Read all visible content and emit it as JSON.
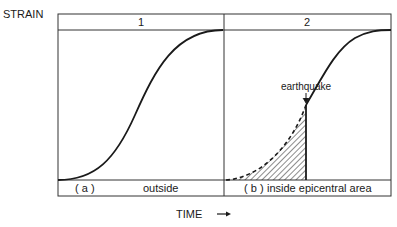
{
  "diagram": {
    "y_axis_label": "STRAIN",
    "x_axis_label": "TIME",
    "x_axis_arrow": "→",
    "panels": [
      {
        "number": "1",
        "caption_letter": "( a )",
        "caption_text": "outside"
      },
      {
        "number": "2",
        "caption_letter": "( b )",
        "caption_text": "inside epicentral area"
      }
    ],
    "event_label": "earthquake",
    "colors": {
      "line": "#1a1a1a",
      "frame": "#333333",
      "background": "#ffffff"
    }
  }
}
